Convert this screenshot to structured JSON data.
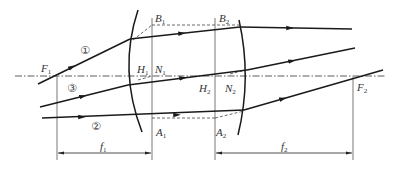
{
  "diagram": {
    "colors": {
      "ray": "#1a1a1a",
      "construction": "#555555",
      "axis": "#333333",
      "background": "#ffffff"
    },
    "labels": {
      "F1": {
        "main": "F",
        "sub": "1"
      },
      "F2": {
        "main": "F",
        "sub": "2"
      },
      "B1": {
        "main": "B",
        "sub": "1"
      },
      "B2": {
        "main": "B",
        "sub": "2"
      },
      "H1": {
        "main": "H",
        "sub": "1"
      },
      "H2": {
        "main": "H",
        "sub": "2"
      },
      "N1": {
        "main": "N",
        "sub": "1"
      },
      "N2": {
        "main": "N",
        "sub": "2"
      },
      "A1": {
        "main": "A",
        "sub": "1"
      },
      "A2": {
        "main": "A",
        "sub": "2"
      },
      "f1": {
        "main": "f",
        "sub": "1"
      },
      "f2": {
        "main": "f",
        "sub": "2"
      }
    },
    "rays": [
      {
        "id": "1",
        "marker": "①"
      },
      {
        "id": "2",
        "marker": "②"
      },
      {
        "id": "3",
        "marker": "③"
      }
    ],
    "dimensions": [
      {
        "name": "f1",
        "from": "F1",
        "to": "plane-1"
      },
      {
        "name": "f2",
        "from": "plane-2",
        "to": "F2"
      }
    ]
  }
}
